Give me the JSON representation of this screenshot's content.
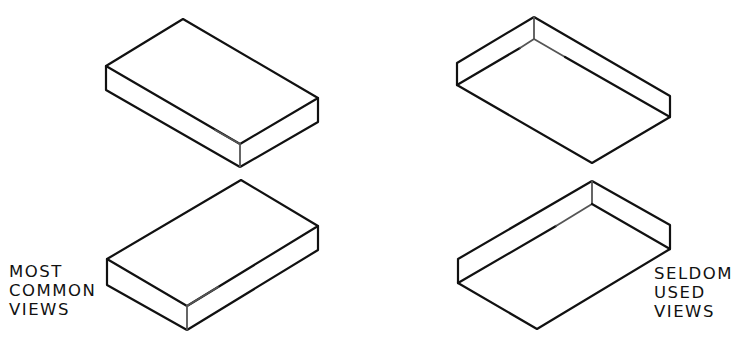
{
  "figure": {
    "labels": {
      "left": {
        "lines": [
          "MOST",
          "COMMON",
          "VIEWS"
        ]
      },
      "right": {
        "lines": [
          "SELDOM",
          "USED",
          "VIEWS"
        ]
      }
    },
    "views": [
      {
        "id": "top-left",
        "group": "most-common",
        "orientation": "viewed from above, long axis to lower right"
      },
      {
        "id": "top-right",
        "group": "seldom-used",
        "orientation": "viewed from below, long axis to lower right"
      },
      {
        "id": "bottom-left",
        "group": "most-common",
        "orientation": "viewed from above, long axis to upper right"
      },
      {
        "id": "bottom-right",
        "group": "seldom-used",
        "orientation": "viewed from below, long axis to upper right"
      }
    ]
  }
}
